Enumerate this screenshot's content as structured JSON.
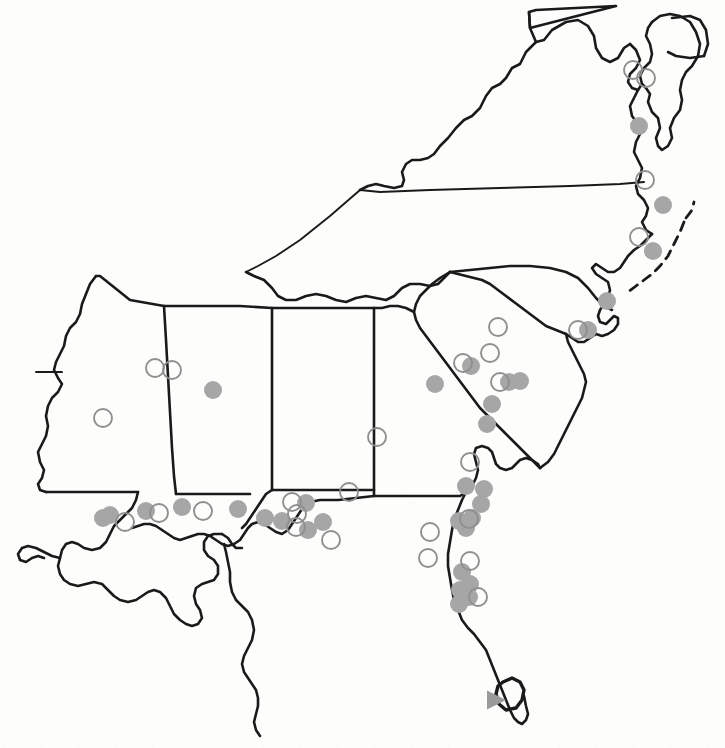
{
  "figure": {
    "kind": "point-occurrence-map",
    "width": 725,
    "height": 748,
    "background_color": "#fdfdfc",
    "outline_color": "#1a1a1a"
  },
  "legend": {
    "filled_circle_label": "filled gray circle record",
    "open_circle_label": "open circle record",
    "triangle_label": "gray triangle record",
    "marker_fill_color": "#a6a6a6",
    "marker_open_stroke_color": "#8f8f8f",
    "triangle_color": "#9a9a9a",
    "marker_radius": 9,
    "open_marker_radius": 9
  },
  "regions": [
    {
      "name": "arkansas"
    },
    {
      "name": "mississippi"
    },
    {
      "name": "alabama"
    },
    {
      "name": "georgia"
    },
    {
      "name": "florida"
    },
    {
      "name": "south-carolina"
    },
    {
      "name": "north-carolina"
    },
    {
      "name": "virginia"
    },
    {
      "name": "maryland"
    },
    {
      "name": "delmarva-peninsula"
    },
    {
      "name": "louisiana"
    },
    {
      "name": "tennessee-kentucky-boundary"
    },
    {
      "name": "lake-okeechobee"
    },
    {
      "name": "outer-banks"
    }
  ],
  "markers": {
    "filled": [
      {
        "x": 639,
        "y": 126
      },
      {
        "x": 663,
        "y": 205
      },
      {
        "x": 653,
        "y": 251
      },
      {
        "x": 607,
        "y": 301
      },
      {
        "x": 588,
        "y": 330
      },
      {
        "x": 213,
        "y": 390
      },
      {
        "x": 435,
        "y": 384
      },
      {
        "x": 471,
        "y": 366
      },
      {
        "x": 509,
        "y": 382
      },
      {
        "x": 520,
        "y": 381
      },
      {
        "x": 492,
        "y": 404
      },
      {
        "x": 487,
        "y": 424
      },
      {
        "x": 110,
        "y": 515
      },
      {
        "x": 182,
        "y": 507
      },
      {
        "x": 146,
        "y": 511
      },
      {
        "x": 238,
        "y": 509
      },
      {
        "x": 265,
        "y": 518
      },
      {
        "x": 282,
        "y": 521
      },
      {
        "x": 306,
        "y": 503
      },
      {
        "x": 323,
        "y": 522
      },
      {
        "x": 308,
        "y": 530
      },
      {
        "x": 466,
        "y": 486
      },
      {
        "x": 484,
        "y": 489
      },
      {
        "x": 481,
        "y": 504
      },
      {
        "x": 472,
        "y": 518
      },
      {
        "x": 466,
        "y": 528
      },
      {
        "x": 459,
        "y": 521
      },
      {
        "x": 462,
        "y": 572
      },
      {
        "x": 470,
        "y": 584
      },
      {
        "x": 460,
        "y": 590
      },
      {
        "x": 469,
        "y": 597
      },
      {
        "x": 459,
        "y": 604
      },
      {
        "x": 103,
        "y": 518
      }
    ],
    "open": [
      {
        "x": 633,
        "y": 70
      },
      {
        "x": 646,
        "y": 78
      },
      {
        "x": 645,
        "y": 180
      },
      {
        "x": 639,
        "y": 237
      },
      {
        "x": 498,
        "y": 327
      },
      {
        "x": 490,
        "y": 353
      },
      {
        "x": 463,
        "y": 363
      },
      {
        "x": 500,
        "y": 382
      },
      {
        "x": 578,
        "y": 330
      },
      {
        "x": 155,
        "y": 368
      },
      {
        "x": 172,
        "y": 370
      },
      {
        "x": 103,
        "y": 418
      },
      {
        "x": 377,
        "y": 437
      },
      {
        "x": 349,
        "y": 492
      },
      {
        "x": 292,
        "y": 502
      },
      {
        "x": 297,
        "y": 514
      },
      {
        "x": 125,
        "y": 522
      },
      {
        "x": 159,
        "y": 513
      },
      {
        "x": 203,
        "y": 511
      },
      {
        "x": 296,
        "y": 527
      },
      {
        "x": 331,
        "y": 540
      },
      {
        "x": 430,
        "y": 532
      },
      {
        "x": 428,
        "y": 558
      },
      {
        "x": 469,
        "y": 519
      },
      {
        "x": 470,
        "y": 561
      },
      {
        "x": 478,
        "y": 597
      },
      {
        "x": 470,
        "y": 462
      }
    ],
    "triangle": [
      {
        "x": 497,
        "y": 700
      }
    ]
  }
}
